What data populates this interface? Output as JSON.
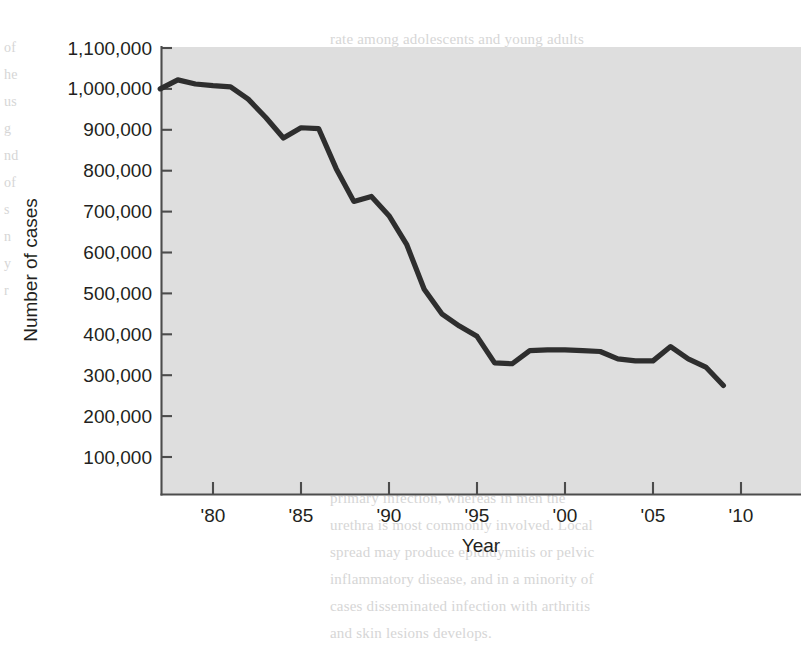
{
  "chart_data": {
    "type": "line",
    "title": "",
    "xlabel": "Year",
    "ylabel": "Number of cases",
    "xlim": [
      1977,
      2010
    ],
    "ylim": [
      0,
      1150000
    ],
    "grid": false,
    "legend": "none",
    "y_ticks": [
      100000,
      200000,
      300000,
      400000,
      500000,
      600000,
      700000,
      800000,
      900000,
      1000000,
      1100000
    ],
    "y_tick_labels": [
      "100,000",
      "200,000",
      "300,000",
      "400,000",
      "500,000",
      "600,000",
      "700,000",
      "800,000",
      "900,000",
      "1,000,000",
      "1,100,000"
    ],
    "x_ticks": [
      1980,
      1985,
      1990,
      1995,
      2000,
      2005,
      2010
    ],
    "x_tick_labels": [
      "'80",
      "'85",
      "'90",
      "'95",
      "'00",
      "'05",
      "'10"
    ],
    "series": [
      {
        "name": "Number of cases",
        "color": "#2e2e2e",
        "x": [
          1977,
          1978,
          1979,
          1980,
          1981,
          1982,
          1983,
          1984,
          1985,
          1986,
          1987,
          1988,
          1989,
          1990,
          1991,
          1992,
          1993,
          1994,
          1995,
          1996,
          1997,
          1998,
          1999,
          2000,
          2001,
          2002,
          2003,
          2004,
          2005,
          2006,
          2007,
          2008,
          2009
        ],
        "y": [
          1000000,
          1022000,
          1012000,
          1008000,
          1005000,
          975000,
          930000,
          880000,
          905000,
          903000,
          805000,
          725000,
          737000,
          690000,
          620000,
          510000,
          450000,
          420000,
          395000,
          330000,
          328000,
          360000,
          362000,
          362000,
          360000,
          358000,
          340000,
          335000,
          335000,
          370000,
          340000,
          320000,
          275000
        ]
      }
    ]
  },
  "ghost_text": {
    "col1": "of\nhe\nus\ng\nnd\nof\ns\nn\ny\nr",
    "col2": "rate among adolescents and young adults\nremained high. Control efforts renewed in\nwith wider screening and reporting led to a\nfurther decline in reported cases. Rates of\ninfection among men and women are now\nclosely matched, although the relative\nburden of disease differs between regions.\n\nPathogenesis\n\nThe organism is a gram-negative diplococcus\nthat infects the mucous membranes of the\nurogenital tract, rectum, pharynx, and eye.\nAttachment to epithelial cells is mediated\nby pili and opacity proteins, and invasion\nfollows within hours of exposure. In\nwomen the cervix is the usual site of\nprimary infection, whereas in men the\nurethra is most commonly involved. Local\nspread may produce epididymitis or pelvic\ninflammatory disease, and in a minority of\ncases disseminated infection with arthritis\nand skin lesions develops."
  }
}
